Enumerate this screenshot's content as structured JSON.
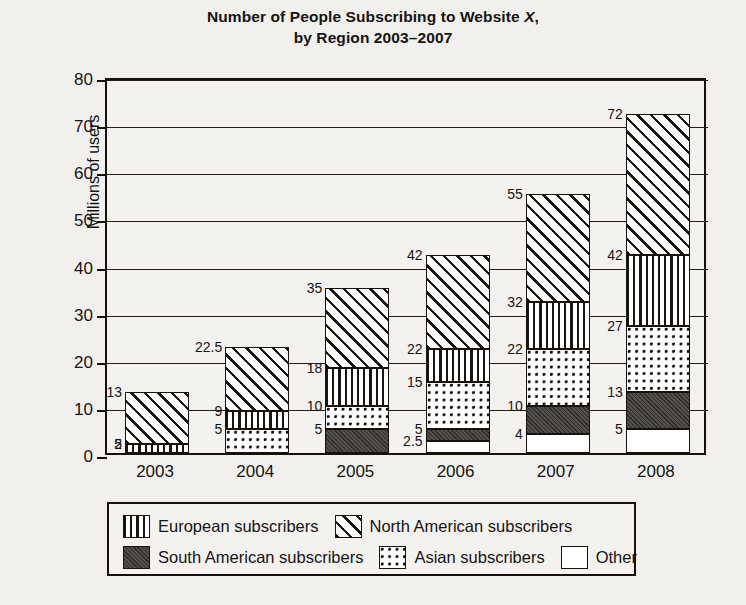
{
  "chart_data": {
    "type": "bar",
    "subtype": "stacked-bar",
    "title_line1": "Number of People Subscribing to Website ",
    "title_italic": "X",
    "title_line1_end": ",",
    "title_line2": "by Region 2003–2007",
    "xlabel": "",
    "ylabel": "Millions of users",
    "ylim": [
      0,
      80
    ],
    "ytick_step": 10,
    "yticks": [
      "0",
      "10",
      "20",
      "30",
      "40",
      "50",
      "60",
      "70",
      "80"
    ],
    "grid": true,
    "legend_position": "below-plot",
    "categories": [
      "2003",
      "2004",
      "2005",
      "2006",
      "2007",
      "2008"
    ],
    "series": [
      {
        "name": "Other",
        "key": "other",
        "pattern": "white",
        "values": [
          0,
          0,
          0,
          2.5,
          4,
          5
        ]
      },
      {
        "name": "South American subscribers",
        "key": "south-american",
        "pattern": "solid-dark",
        "values": [
          0,
          0,
          5,
          2.5,
          6,
          8
        ]
      },
      {
        "name": "Asian subscribers",
        "key": "asian",
        "pattern": "dotted-grid",
        "values": [
          0,
          5,
          5,
          10,
          12,
          14
        ]
      },
      {
        "name": "European subscribers",
        "key": "european",
        "pattern": "vertical-stripes",
        "values": [
          2,
          4,
          8,
          7,
          10,
          15
        ]
      },
      {
        "name": "North American subscribers",
        "key": "north-american",
        "pattern": "diagonal-hatch",
        "values": [
          11,
          13.5,
          17,
          20,
          23,
          30
        ]
      }
    ],
    "cumulative_totals": [
      13,
      22.5,
      35,
      42,
      55,
      72
    ],
    "bars": [
      {
        "category": "2003",
        "segments": [
          {
            "series": "European subscribers",
            "pattern": "vertical-stripes",
            "from": 0,
            "to": 2,
            "label": "2"
          },
          {
            "series": "North American subscribers",
            "pattern": "diagonal-hatch",
            "from": 2,
            "to": 13,
            "label": "13"
          }
        ],
        "extra_labels": [
          "5"
        ]
      },
      {
        "category": "2004",
        "segments": [
          {
            "series": "Asian subscribers",
            "pattern": "dotted-grid",
            "from": 0,
            "to": 5,
            "label": "5"
          },
          {
            "series": "European subscribers",
            "pattern": "vertical-stripes",
            "from": 5,
            "to": 9,
            "label": "9"
          },
          {
            "series": "North American subscribers",
            "pattern": "diagonal-hatch",
            "from": 9,
            "to": 22.5,
            "label": "22.5"
          }
        ],
        "extra_labels": []
      },
      {
        "category": "2005",
        "segments": [
          {
            "series": "South American subscribers",
            "pattern": "solid-dark",
            "from": 0,
            "to": 5,
            "label": "5"
          },
          {
            "series": "Asian subscribers",
            "pattern": "dotted-grid",
            "from": 5,
            "to": 10,
            "label": "10"
          },
          {
            "series": "European subscribers",
            "pattern": "vertical-stripes",
            "from": 10,
            "to": 18,
            "label": "18"
          },
          {
            "series": "North American subscribers",
            "pattern": "diagonal-hatch",
            "from": 18,
            "to": 35,
            "label": "35"
          }
        ],
        "extra_labels": []
      },
      {
        "category": "2006",
        "segments": [
          {
            "series": "Other",
            "pattern": "white",
            "from": 0,
            "to": 2.5,
            "label": "2.5"
          },
          {
            "series": "South American subscribers",
            "pattern": "solid-dark",
            "from": 2.5,
            "to": 5,
            "label": "5"
          },
          {
            "series": "Asian subscribers",
            "pattern": "dotted-grid",
            "from": 5,
            "to": 15,
            "label": "15"
          },
          {
            "series": "European subscribers",
            "pattern": "vertical-stripes",
            "from": 15,
            "to": 22,
            "label": "22"
          },
          {
            "series": "North American subscribers",
            "pattern": "diagonal-hatch",
            "from": 22,
            "to": 42,
            "label": "42"
          }
        ],
        "extra_labels": []
      },
      {
        "category": "2007",
        "segments": [
          {
            "series": "Other",
            "pattern": "white",
            "from": 0,
            "to": 4,
            "label": "4"
          },
          {
            "series": "South American subscribers",
            "pattern": "solid-dark",
            "from": 4,
            "to": 10,
            "label": "10"
          },
          {
            "series": "Asian subscribers",
            "pattern": "dotted-grid",
            "from": 10,
            "to": 22,
            "label": "22"
          },
          {
            "series": "European subscribers",
            "pattern": "vertical-stripes",
            "from": 22,
            "to": 32,
            "label": "32"
          },
          {
            "series": "North American subscribers",
            "pattern": "diagonal-hatch",
            "from": 32,
            "to": 55,
            "label": "55"
          }
        ],
        "extra_labels": []
      },
      {
        "category": "2008",
        "segments": [
          {
            "series": "Other",
            "pattern": "white",
            "from": 0,
            "to": 5,
            "label": "5"
          },
          {
            "series": "South American subscribers",
            "pattern": "solid-dark",
            "from": 5,
            "to": 13,
            "label": "13"
          },
          {
            "series": "Asian subscribers",
            "pattern": "dotted-grid",
            "from": 13,
            "to": 27,
            "label": "27"
          },
          {
            "series": "European subscribers",
            "pattern": "vertical-stripes",
            "from": 27,
            "to": 42,
            "label": "42"
          },
          {
            "series": "North American subscribers",
            "pattern": "diagonal-hatch",
            "from": 42,
            "to": 72,
            "label": "72"
          }
        ],
        "extra_labels": []
      }
    ],
    "legend": [
      {
        "label": "European subscribers",
        "pattern": "vertical-stripes"
      },
      {
        "label": "North American subscribers",
        "pattern": "diagonal-hatch"
      },
      {
        "label": "South American subscribers",
        "pattern": "solid-dark"
      },
      {
        "label": "Asian subscribers",
        "pattern": "dotted-grid"
      },
      {
        "label": "Other",
        "pattern": "white"
      }
    ],
    "colors": {
      "ink": "#17110e",
      "paper": "#f2f0ec",
      "plot_background": "#f4f2ee",
      "solid_dark": "#4a4744"
    }
  }
}
